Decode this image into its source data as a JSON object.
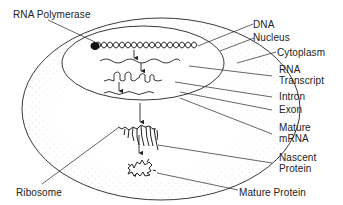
{
  "diagram": {
    "type": "gene-expression-cell-diagram",
    "colors": {
      "line": "#222222",
      "stipple": "#9a9a9a",
      "background": "#ffffff"
    },
    "labels": {
      "rna_polymerase": "RNA Polymerase",
      "dna": "DNA",
      "nucleus": "Nucleus",
      "cytoplasm": "Cytoplasm",
      "rna_transcript_1": "RNA",
      "rna_transcript_2": "Transcript",
      "intron": "Intron",
      "exon": "Exon",
      "mature_mrna_1": "Mature",
      "mature_mrna_2": "mRNA",
      "nascent_protein_1": "Nascent",
      "nascent_protein_2": "Protein",
      "ribosome": "Ribosome",
      "mature_protein": "Mature Protein"
    },
    "flow": [
      "DNA",
      "RNA Transcript",
      "Intron/Exon splicing",
      "Mature mRNA",
      "Nascent Protein",
      "Mature Protein"
    ]
  }
}
